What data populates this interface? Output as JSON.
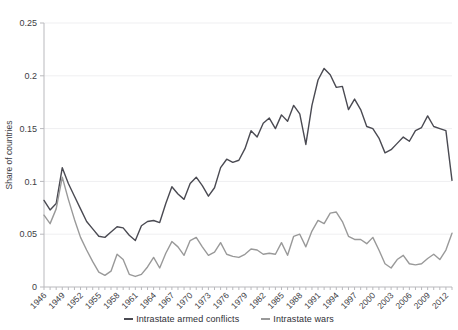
{
  "chart_data": {
    "type": "line",
    "title": "",
    "subtitle": "",
    "xlabel": "",
    "ylabel": "Share of countries",
    "xlim": [
      1946,
      2013
    ],
    "ylim": [
      0,
      0.25
    ],
    "grid": true,
    "legend_position": "bottom-center",
    "ytick_labels": [
      "0",
      "0.05",
      "0.1",
      "0.15",
      "0.2",
      "0.25"
    ],
    "ytick_values": [
      0,
      0.05,
      0.1,
      0.15,
      0.2,
      0.25
    ],
    "xtick_labels": [
      "1946",
      "1949",
      "1952",
      "1955",
      "1958",
      "1961",
      "1964",
      "1967",
      "1970",
      "1973",
      "1976",
      "1979",
      "1982",
      "1985",
      "1988",
      "1991",
      "1994",
      "1997",
      "2000",
      "2003",
      "2006",
      "2009",
      "2012"
    ],
    "xtick_values": [
      1946,
      1949,
      1952,
      1955,
      1958,
      1961,
      1964,
      1967,
      1970,
      1973,
      1976,
      1979,
      1982,
      1985,
      1988,
      1991,
      1994,
      1997,
      2000,
      2003,
      2006,
      2009,
      2012
    ],
    "x": [
      1946,
      1947,
      1948,
      1949,
      1950,
      1951,
      1952,
      1953,
      1954,
      1955,
      1956,
      1957,
      1958,
      1959,
      1960,
      1961,
      1962,
      1963,
      1964,
      1965,
      1966,
      1967,
      1968,
      1969,
      1970,
      1971,
      1972,
      1973,
      1974,
      1975,
      1976,
      1977,
      1978,
      1979,
      1980,
      1981,
      1982,
      1983,
      1984,
      1985,
      1986,
      1987,
      1988,
      1989,
      1990,
      1991,
      1992,
      1993,
      1994,
      1995,
      1996,
      1997,
      1998,
      1999,
      2000,
      2001,
      2002,
      2003,
      2004,
      2005,
      2006,
      2007,
      2008,
      2009,
      2010,
      2011,
      2012,
      2013
    ],
    "series": [
      {
        "name": "Intrastate armed conflicts",
        "color": "#4a4a52",
        "values": [
          0.082,
          0.073,
          0.079,
          0.113,
          0.098,
          0.086,
          0.074,
          0.062,
          0.055,
          0.048,
          0.047,
          0.052,
          0.057,
          0.056,
          0.049,
          0.044,
          0.058,
          0.062,
          0.063,
          0.061,
          0.079,
          0.095,
          0.088,
          0.083,
          0.098,
          0.104,
          0.096,
          0.086,
          0.094,
          0.113,
          0.121,
          0.118,
          0.12,
          0.131,
          0.148,
          0.142,
          0.155,
          0.16,
          0.15,
          0.163,
          0.157,
          0.172,
          0.164,
          0.135,
          0.172,
          0.196,
          0.207,
          0.201,
          0.189,
          0.19,
          0.168,
          0.178,
          0.168,
          0.152,
          0.15,
          0.141,
          0.127,
          0.13,
          0.136,
          0.142,
          0.138,
          0.148,
          0.151,
          0.162,
          0.152,
          0.15,
          0.148,
          0.101
        ]
      },
      {
        "name": "Intrastate wars",
        "color": "#999999",
        "values": [
          0.068,
          0.06,
          0.074,
          0.104,
          0.083,
          0.064,
          0.047,
          0.035,
          0.024,
          0.014,
          0.011,
          0.015,
          0.031,
          0.026,
          0.012,
          0.01,
          0.012,
          0.019,
          0.028,
          0.018,
          0.032,
          0.043,
          0.038,
          0.03,
          0.044,
          0.047,
          0.038,
          0.03,
          0.033,
          0.042,
          0.031,
          0.029,
          0.028,
          0.031,
          0.036,
          0.035,
          0.031,
          0.032,
          0.031,
          0.042,
          0.03,
          0.048,
          0.05,
          0.038,
          0.053,
          0.063,
          0.06,
          0.07,
          0.071,
          0.062,
          0.048,
          0.045,
          0.045,
          0.041,
          0.047,
          0.035,
          0.022,
          0.018,
          0.026,
          0.03,
          0.022,
          0.021,
          0.022,
          0.027,
          0.031,
          0.026,
          0.035,
          0.051
        ]
      }
    ]
  },
  "legend": {
    "items": [
      {
        "label": "Intrastate armed conflicts",
        "color": "#4a4a52"
      },
      {
        "label": "Intrastate wars",
        "color": "#999999"
      }
    ]
  },
  "axes": {
    "y_title": "Share of countries"
  }
}
